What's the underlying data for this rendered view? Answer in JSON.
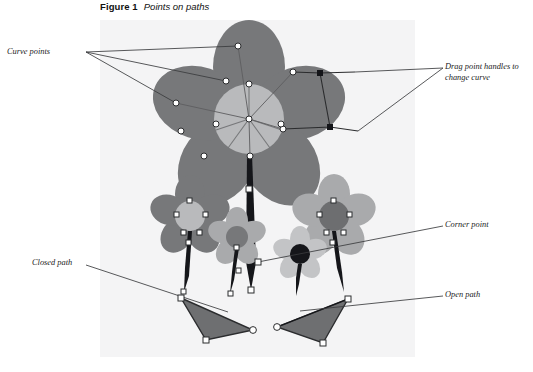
{
  "figure": {
    "caption_label": "Figure 1",
    "caption_title": "Points on paths",
    "panel": {
      "x": 100,
      "y": 20,
      "width": 315,
      "height": 337,
      "fill": "#f4f4f5"
    }
  },
  "annotations": [
    {
      "id": "curve-points",
      "text": "Curve points",
      "x": 7,
      "y": 47
    },
    {
      "id": "drag-handles",
      "text": "Drag point handles to\nchange curve",
      "x": 445,
      "y": 62
    },
    {
      "id": "corner-point",
      "text": "Corner point",
      "x": 445,
      "y": 220
    },
    {
      "id": "closed-path",
      "text": "Closed path",
      "x": 32,
      "y": 258
    },
    {
      "id": "open-path",
      "text": "Open path",
      "x": 445,
      "y": 290
    }
  ],
  "colors": {
    "panel_bg": "#f4f4f5",
    "page_bg": "#ffffff",
    "petal_dark": "#77787a",
    "petal_mid": "#8e8f91",
    "petal_light": "#a9aaac",
    "center_light": "#b9babc",
    "center_dark": "#6d6e70",
    "stem_black": "#15161a",
    "leaf_fill": "#6e6f71",
    "leaf_stroke": "#2b2c2e",
    "leader_line": "#3a3b3d",
    "anchor_fill": "#ffffff",
    "anchor_stroke": "#2b2c2e",
    "handle_fill": "#141519",
    "text": "#1a1a1a"
  },
  "leader_lines": {
    "curve_points": [
      {
        "from": [
          86,
          52
        ],
        "to": [
          238,
          46
        ]
      },
      {
        "from": [
          86,
          52
        ],
        "to": [
          226,
          81
        ]
      },
      {
        "from": [
          86,
          52
        ],
        "to": [
          176,
          103
        ]
      }
    ],
    "drag_handles": [
      {
        "from": [
          443,
          68
        ],
        "to": [
          355,
          72
        ]
      },
      {
        "from": [
          443,
          68
        ],
        "to": [
          358,
          131
        ]
      }
    ],
    "corner_point": [
      {
        "from": [
          443,
          226
        ],
        "to": [
          258,
          262
        ]
      }
    ],
    "closed_path": [
      {
        "from": [
          86,
          265
        ],
        "to": [
          228,
          312
        ]
      }
    ],
    "open_path": [
      {
        "from": [
          443,
          296
        ],
        "to": [
          300,
          311
        ]
      }
    ]
  },
  "artwork": {
    "big_flower": {
      "center": [
        249,
        119
      ],
      "center_radius": 35,
      "petal_count": 5,
      "petals": [
        {
          "angle": -90,
          "rx": 36,
          "ry": 47,
          "dist": 52
        },
        {
          "angle": -18,
          "rx": 36,
          "ry": 47,
          "dist": 52
        },
        {
          "angle": 54,
          "rx": 36,
          "ry": 47,
          "dist": 52
        },
        {
          "angle": 126,
          "rx": 36,
          "ry": 47,
          "dist": 52
        },
        {
          "angle": 198,
          "rx": 36,
          "ry": 47,
          "dist": 52
        }
      ],
      "anchor_points": [
        [
          238,
          46
        ],
        [
          293,
          72
        ],
        [
          283,
          129
        ],
        [
          226,
          81
        ],
        [
          176,
          103
        ],
        [
          181,
          131
        ],
        [
          216,
          124
        ],
        [
          249,
          119
        ],
        [
          281,
          124
        ],
        [
          250,
          156
        ],
        [
          249,
          190
        ],
        [
          213,
          206
        ],
        [
          320,
          73
        ],
        [
          330,
          127
        ]
      ]
    },
    "mid_left_flower": {
      "center": [
        190,
        216
      ],
      "center_radius": 15,
      "petal_rx": 15,
      "petal_ry": 19,
      "dist": 22,
      "stem_to": [
        183,
        292
      ]
    },
    "mid_left_small_flower": {
      "center": [
        237,
        237
      ],
      "center_radius": 11,
      "petal_rx": 11,
      "petal_ry": 14,
      "dist": 16,
      "stem_to": [
        231,
        294
      ]
    },
    "mid_right_flower": {
      "center": [
        334,
        216
      ],
      "center_radius": 15,
      "petal_rx": 16,
      "petal_ry": 20,
      "dist": 22,
      "stem_to": [
        343,
        292
      ]
    },
    "mid_right_small_flower": {
      "center": [
        300,
        254
      ],
      "center_radius": 10,
      "petal_rx": 10,
      "petal_ry": 13,
      "dist": 15,
      "stem_to": [
        297,
        296
      ]
    },
    "left_triangle": {
      "points": "181,298 253,330 206,340",
      "label": "closed path"
    },
    "right_triangle": {
      "points": "348,299 277,327 323,343",
      "label": "open path"
    }
  }
}
